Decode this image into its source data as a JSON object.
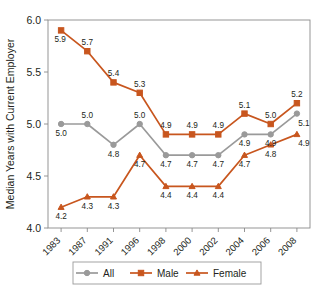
{
  "chart_data": {
    "type": "line",
    "title": "",
    "xlabel": "",
    "ylabel": "Median Years with Current Employer",
    "categories": [
      "1983",
      "1987",
      "1991",
      "1996",
      "1998",
      "2000",
      "2002",
      "2004",
      "2006",
      "2008"
    ],
    "ylim": [
      4.0,
      6.0
    ],
    "yticks": [
      "4.0",
      "4.5",
      "5.0",
      "5.5",
      "6.0"
    ],
    "ytick_values": [
      4.0,
      4.5,
      5.0,
      5.5,
      6.0
    ],
    "grid": false,
    "legend_position": "bottom",
    "series": [
      {
        "name": "All",
        "color": "#9a9a9a",
        "marker": "circle",
        "values": [
          5.0,
          5.0,
          4.8,
          5.0,
          4.7,
          4.7,
          4.7,
          4.9,
          4.9,
          5.1
        ],
        "labels": [
          "5.0",
          "5.0",
          "4.8",
          "5.0",
          "4.7",
          "4.7",
          "4.7",
          "4.9",
          "4.9",
          "5.1"
        ]
      },
      {
        "name": "Male",
        "color": "#c8561e",
        "marker": "square",
        "values": [
          5.9,
          5.7,
          5.4,
          5.3,
          4.9,
          4.9,
          4.9,
          5.1,
          5.0,
          5.2
        ],
        "labels": [
          "5.9",
          "5.7",
          "5.4",
          "5.3",
          "4.9",
          "4.9",
          "4.9",
          "5.1",
          "5.0",
          "5.2"
        ]
      },
      {
        "name": "Female",
        "color": "#c8561e",
        "marker": "triangle",
        "values": [
          4.2,
          4.3,
          4.3,
          4.7,
          4.4,
          4.4,
          4.4,
          4.7,
          4.8,
          4.9
        ],
        "labels": [
          "4.2",
          "4.3",
          "4.3",
          "4.7",
          "4.4",
          "4.4",
          "4.4",
          "4.7",
          "4.8",
          "4.9"
        ]
      }
    ]
  },
  "legend": {
    "items": [
      {
        "label": "All",
        "color": "#9a9a9a",
        "marker": "circle"
      },
      {
        "label": "Male",
        "color": "#c8561e",
        "marker": "square"
      },
      {
        "label": "Female",
        "color": "#c8561e",
        "marker": "triangle"
      }
    ]
  },
  "colors": {
    "orange": "#c8561e",
    "gray": "#9a9a9a",
    "axis": "#8a8a8a",
    "text": "#231f20",
    "background": "#ffffff"
  }
}
